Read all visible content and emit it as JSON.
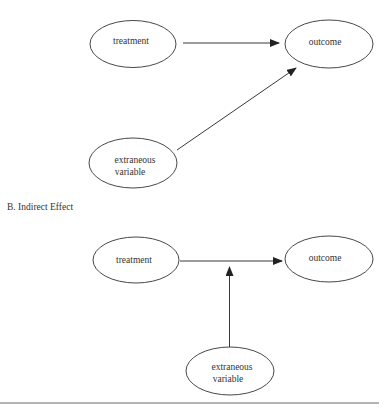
{
  "diagram_a": {
    "nodes": {
      "treatment": {
        "label": "treatment"
      },
      "outcome": {
        "label": "outcome"
      },
      "extraneous": {
        "line1": "extraneous",
        "line2": "variable"
      }
    },
    "edges": [
      {
        "from": "treatment",
        "to": "outcome"
      },
      {
        "from": "extraneous",
        "to": "outcome"
      }
    ]
  },
  "diagram_b": {
    "title": "B. Indirect Effect",
    "nodes": {
      "treatment": {
        "label": "treatment"
      },
      "outcome": {
        "label": "outcome"
      },
      "extraneous": {
        "line1": "extraneous",
        "line2": "variable"
      }
    },
    "edges": [
      {
        "from": "treatment",
        "to": "outcome"
      },
      {
        "from": "extraneous",
        "to": "treatment-outcome-edge"
      }
    ]
  },
  "colors": {
    "stroke": "#333333",
    "background": "#ffffff"
  }
}
